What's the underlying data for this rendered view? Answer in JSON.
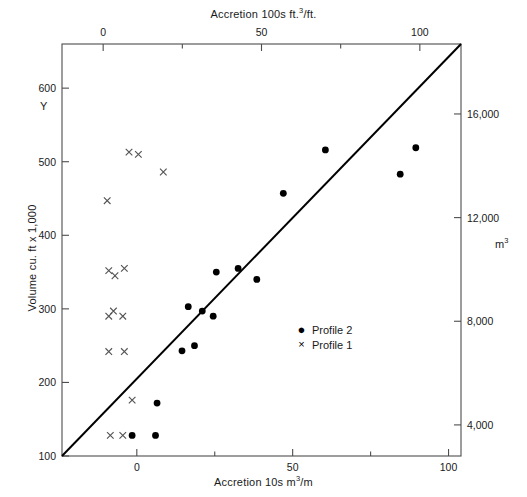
{
  "axes": {
    "top": {
      "title_prefix": "Accretion  100s ft.",
      "title_sup": "3",
      "title_suffix": "/ft.",
      "ticks": [
        {
          "label": "0",
          "value": 0
        },
        {
          "label": "50",
          "value": 50
        },
        {
          "label": "100",
          "value": 100
        }
      ],
      "minor_values": [
        25,
        75,
        125
      ],
      "range": [
        -13,
        113
      ]
    },
    "bottom": {
      "title_prefix": "Accretion  10s m",
      "title_sup": "3",
      "title_suffix": "/m",
      "ticks": [
        {
          "label": "0",
          "value": 0
        },
        {
          "label": "50",
          "value": 50
        },
        {
          "label": "100",
          "value": 100
        }
      ],
      "minor_values": [
        25,
        75
      ],
      "range": [
        -24,
        104
      ]
    },
    "left": {
      "title": "Volume cu. ft x 1,000",
      "corner_label": "Y",
      "ticks": [
        {
          "label": "600",
          "value": 600
        },
        {
          "label": "500",
          "value": 500
        },
        {
          "label": "400",
          "value": 400
        },
        {
          "label": "300",
          "value": 300
        },
        {
          "label": "200",
          "value": 200
        },
        {
          "label": "100",
          "value": 100
        }
      ],
      "range": [
        100,
        660
      ]
    },
    "right": {
      "corner_label": "m",
      "corner_label_sup": "3",
      "ticks": [
        {
          "label": "16,000",
          "value": 16000
        },
        {
          "label": "12,000",
          "value": 12000
        },
        {
          "label": "8,000",
          "value": 8000
        },
        {
          "label": "4,000",
          "value": 4000
        }
      ],
      "range": [
        2800,
        18700
      ]
    }
  },
  "legend": {
    "items": [
      {
        "marker": "dot",
        "glyph": "●",
        "label": "Profile 2"
      },
      {
        "marker": "cross",
        "glyph": "×",
        "label": "Profile 1"
      }
    ]
  },
  "chart_data": {
    "type": "scatter",
    "title": "Accretion  100s ft.3/ft.",
    "xlabel": "Accretion  10s m3/m",
    "ylabel": "Volume cu. ft x 1,000",
    "xlim": [
      -24,
      104
    ],
    "ylim": [
      100,
      660
    ],
    "grid": false,
    "legend_position": "center-right",
    "series": [
      {
        "name": "Profile 2",
        "marker": "dot",
        "color": "#000000",
        "points": [
          {
            "x": -1.5,
            "y": 128
          },
          {
            "x": 6.0,
            "y": 128
          },
          {
            "x": 6.5,
            "y": 172
          },
          {
            "x": 14.5,
            "y": 243
          },
          {
            "x": 18.5,
            "y": 250
          },
          {
            "x": 16.5,
            "y": 303
          },
          {
            "x": 21.0,
            "y": 297
          },
          {
            "x": 24.5,
            "y": 290
          },
          {
            "x": 25.5,
            "y": 350
          },
          {
            "x": 32.5,
            "y": 355
          },
          {
            "x": 38.5,
            "y": 340
          },
          {
            "x": 47.0,
            "y": 457
          },
          {
            "x": 60.5,
            "y": 516
          },
          {
            "x": 84.5,
            "y": 483
          },
          {
            "x": 89.5,
            "y": 519
          }
        ]
      },
      {
        "name": "Profile 1",
        "marker": "cross",
        "color": "#555555",
        "points": [
          {
            "x": -8.5,
            "y": 128
          },
          {
            "x": -4.5,
            "y": 128
          },
          {
            "x": -1.5,
            "y": 176
          },
          {
            "x": -9.0,
            "y": 242
          },
          {
            "x": -4.0,
            "y": 242
          },
          {
            "x": -7.5,
            "y": 297
          },
          {
            "x": -9.0,
            "y": 290
          },
          {
            "x": -4.5,
            "y": 290
          },
          {
            "x": -9.0,
            "y": 352
          },
          {
            "x": -4.0,
            "y": 355
          },
          {
            "x": -7.0,
            "y": 345
          },
          {
            "x": -9.5,
            "y": 447
          },
          {
            "x": -2.5,
            "y": 513
          },
          {
            "x": 0.5,
            "y": 510
          },
          {
            "x": 8.5,
            "y": 486
          }
        ]
      }
    ],
    "reference_line": {
      "label": "1:1 reference line",
      "from": {
        "x": -24,
        "y": 100
      },
      "to": {
        "x": 104,
        "y": 660
      }
    }
  }
}
